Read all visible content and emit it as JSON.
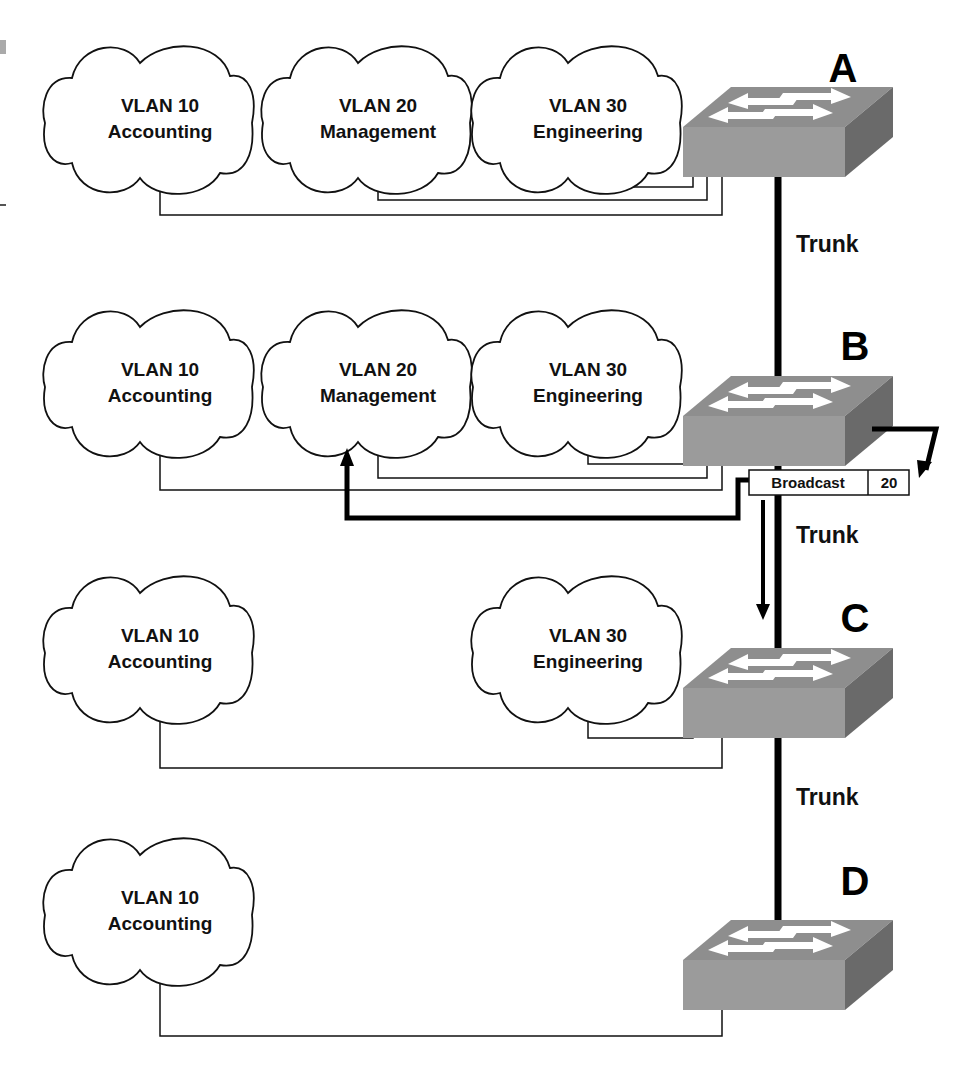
{
  "diagram": {
    "switches": [
      {
        "id": "A",
        "label": "A"
      },
      {
        "id": "B",
        "label": "B"
      },
      {
        "id": "C",
        "label": "C"
      },
      {
        "id": "D",
        "label": "D"
      }
    ],
    "rows": [
      {
        "switch": "A",
        "vlans": [
          {
            "line1": "VLAN 10",
            "line2": "Accounting"
          },
          {
            "line1": "VLAN 20",
            "line2": "Management"
          },
          {
            "line1": "VLAN 30",
            "line2": "Engineering"
          }
        ]
      },
      {
        "switch": "B",
        "vlans": [
          {
            "line1": "VLAN 10",
            "line2": "Accounting"
          },
          {
            "line1": "VLAN 20",
            "line2": "Management"
          },
          {
            "line1": "VLAN 30",
            "line2": "Engineering"
          }
        ]
      },
      {
        "switch": "C",
        "vlans": [
          {
            "line1": "VLAN 10",
            "line2": "Accounting"
          },
          {
            "line1": "VLAN 30",
            "line2": "Engineering"
          }
        ]
      },
      {
        "switch": "D",
        "vlans": [
          {
            "line1": "VLAN 10",
            "line2": "Accounting"
          }
        ]
      }
    ],
    "trunk_labels": [
      "Trunk",
      "Trunk",
      "Trunk"
    ],
    "frame": {
      "label": "Broadcast",
      "vlan": "20"
    },
    "colors": {
      "switch_top": "#8e8e8e",
      "switch_front": "#9b9b9b",
      "switch_side": "#6a6a6a",
      "line": "#111111"
    }
  }
}
